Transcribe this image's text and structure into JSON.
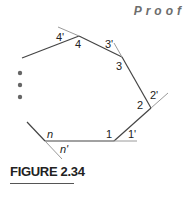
{
  "header": {
    "proof_label": "Proof"
  },
  "figure": {
    "caption": "FIGURE 2.34",
    "labels": {
      "v1": "1",
      "e1": "1'",
      "v2": "2",
      "e2": "2'",
      "v3": "3",
      "e3": "3'",
      "v4": "4",
      "e4": "4'",
      "vn": "n",
      "en": "n'"
    },
    "ellipsis_dots": 3
  },
  "colors": {
    "polygon": "#444444",
    "extension": "#9a9a9a",
    "dots": "#666666"
  }
}
